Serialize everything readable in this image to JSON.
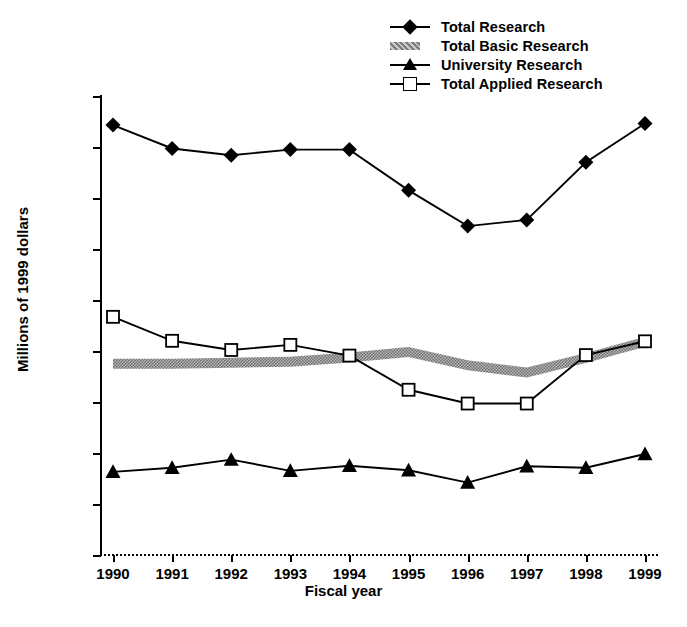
{
  "chart_data": {
    "type": "line",
    "title": "",
    "xlabel": "Fiscal year",
    "ylabel": "Millions of 1999 dollars",
    "categories": [
      "1990",
      "1991",
      "1992",
      "1993",
      "1994",
      "1995",
      "1996",
      "1997",
      "1998",
      "1999"
    ],
    "x": [
      1990,
      1991,
      1992,
      1993,
      1994,
      1995,
      1996,
      1997,
      1998,
      1999
    ],
    "ylim": [
      0,
      900
    ],
    "yticks": [
      0,
      100,
      200,
      300,
      400,
      500,
      600,
      700,
      800,
      900
    ],
    "ytick_labels": [
      "0",
      "100",
      "200",
      "300",
      "400",
      "500",
      "600",
      "700",
      "800",
      "900"
    ],
    "grid": false,
    "legend_position": "top-right",
    "series": [
      {
        "name": "Total Research",
        "marker": "filled-diamond",
        "values": [
          843,
          797,
          784,
          795,
          795,
          715,
          645,
          657,
          770,
          846
        ]
      },
      {
        "name": "Total Basic Research",
        "marker": "gray-band",
        "values": [
          375,
          375,
          377,
          379,
          387,
          398,
          372,
          358,
          386,
          418
        ]
      },
      {
        "name": "University Research",
        "marker": "filled-triangle",
        "values": [
          163,
          171,
          187,
          165,
          175,
          166,
          142,
          174,
          171,
          198
        ]
      },
      {
        "name": "Total Applied Research",
        "marker": "open-square",
        "values": [
          467,
          420,
          402,
          412,
          391,
          324,
          297,
          297,
          392,
          419
        ]
      }
    ]
  },
  "legend": {
    "items": [
      {
        "label": "Total Research",
        "key": "filled-diamond"
      },
      {
        "label": "Total Basic Research",
        "key": "gray-band"
      },
      {
        "label": "University Research",
        "key": "filled-triangle"
      },
      {
        "label": "Total Applied Research",
        "key": "open-square"
      }
    ]
  },
  "axes": {
    "x_title": "Fiscal year",
    "y_title": "Millions of 1999 dollars"
  }
}
